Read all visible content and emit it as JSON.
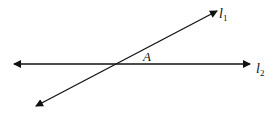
{
  "diagram": {
    "lines": [
      {
        "id": "l1",
        "label": "l",
        "subscript": "1",
        "from": [
          36,
          106
        ],
        "to": [
          217,
          11
        ],
        "arrows": "both"
      },
      {
        "id": "l2",
        "label": "l",
        "subscript": "2",
        "from": [
          14,
          64
        ],
        "to": [
          250,
          64
        ],
        "arrows": "both"
      }
    ],
    "point": {
      "label": "A",
      "position": [
        148,
        58
      ]
    },
    "colors": {
      "stroke": "#111111",
      "background": "#ffffff"
    }
  }
}
